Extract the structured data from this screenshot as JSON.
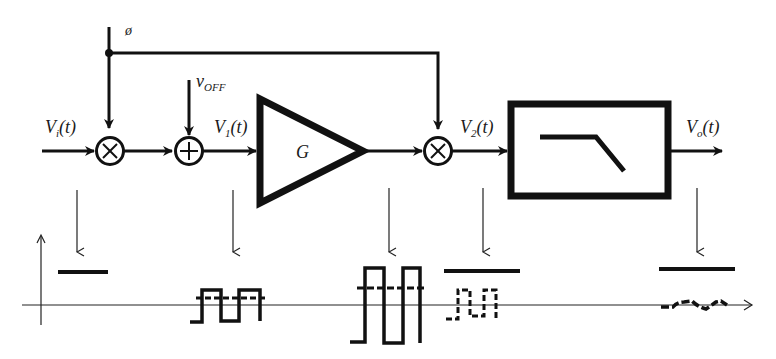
{
  "diagram": {
    "type": "chopper-stabilized amplifier block diagram",
    "colors": {
      "ink": "#111111",
      "background": "#ffffff"
    },
    "labels": {
      "phi": "ø",
      "vin_main": "V",
      "vin_sub": "i",
      "vin_tail": "(t)",
      "voff_main": "v",
      "voff_sub": "OFF",
      "v1_main": "V",
      "v1_sub": "1",
      "v1_tail": "(t)",
      "gain": "G",
      "v2_main": "V",
      "v2_sub": "2",
      "v2_tail": "(t)",
      "vo_main": "V",
      "vo_sub": "o",
      "vo_tail": "(t)"
    },
    "blocks": [
      {
        "id": "mixer-1",
        "kind": "multiplier",
        "symbol": "×"
      },
      {
        "id": "adder",
        "kind": "summer",
        "symbol": "+"
      },
      {
        "id": "amplifier",
        "kind": "gain",
        "symbol": "G"
      },
      {
        "id": "mixer-2",
        "kind": "multiplier",
        "symbol": "×"
      },
      {
        "id": "filter",
        "kind": "low-pass filter",
        "symbol": "lowpass-response"
      }
    ],
    "waveforms": [
      {
        "id": "wave-vi",
        "desc": "constant DC level"
      },
      {
        "id": "wave-v1",
        "desc": "chopped square wave with offset (dashed)"
      },
      {
        "id": "wave-amp",
        "desc": "amplified square wave with amplified offset (dashed)"
      },
      {
        "id": "wave-v2",
        "desc": "DC level plus modulated offset (dashed square wave)"
      },
      {
        "id": "wave-vo",
        "desc": "DC level plus small residual ripple"
      }
    ]
  }
}
